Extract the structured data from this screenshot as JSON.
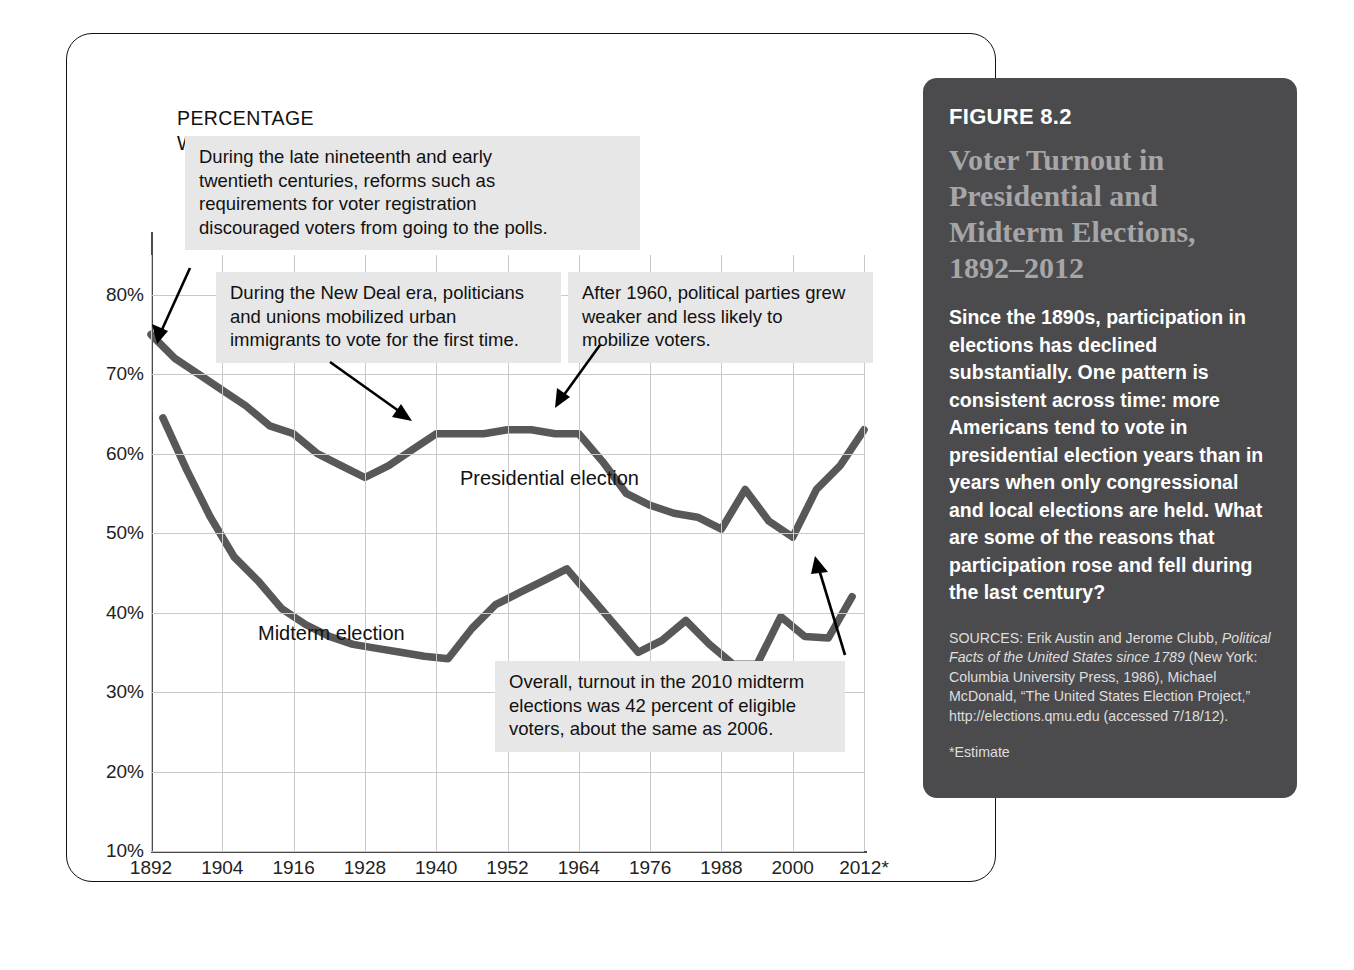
{
  "chart_data": {
    "type": "line",
    "title": "Voter Turnout in Presidential and Midterm Elections, 1892–2012",
    "xlabel": "",
    "ylabel": "PERCENTAGE\nWHO VOTED",
    "ylim": [
      10,
      85
    ],
    "xlim": [
      1892,
      2012
    ],
    "grid": true,
    "legend_position": "in-plot",
    "ytick_labels": [
      "80%",
      "70%",
      "60%",
      "50%",
      "40%",
      "30%",
      "20%",
      "10%"
    ],
    "ytick_values": [
      80,
      70,
      60,
      50,
      40,
      30,
      20,
      10
    ],
    "xtick_labels": [
      "1892",
      "1904",
      "1916",
      "1928",
      "1940",
      "1952",
      "1964",
      "1976",
      "1988",
      "2000",
      "2012*"
    ],
    "xtick_values": [
      1892,
      1904,
      1916,
      1928,
      1940,
      1952,
      1964,
      1976,
      1988,
      2000,
      2012
    ],
    "series": [
      {
        "name": "Presidential election",
        "x": [
          1892,
          1896,
          1900,
          1904,
          1908,
          1912,
          1916,
          1920,
          1924,
          1928,
          1932,
          1936,
          1940,
          1944,
          1948,
          1952,
          1956,
          1960,
          1964,
          1968,
          1972,
          1976,
          1980,
          1984,
          1988,
          1992,
          1996,
          2000,
          2004,
          2008,
          2012
        ],
        "values": [
          75.0,
          72.0,
          70.0,
          68.0,
          66.0,
          63.5,
          62.5,
          60.0,
          58.5,
          57.0,
          58.5,
          60.5,
          62.5,
          62.5,
          62.5,
          63.0,
          63.0,
          62.5,
          62.5,
          59.0,
          55.0,
          53.5,
          52.5,
          52.0,
          50.5,
          55.5,
          51.5,
          49.5,
          55.5,
          58.5,
          63.0
        ]
      },
      {
        "name": "Midterm election",
        "x": [
          1894,
          1898,
          1902,
          1906,
          1910,
          1914,
          1918,
          1922,
          1926,
          1930,
          1934,
          1938,
          1942,
          1946,
          1950,
          1954,
          1958,
          1962,
          1966,
          1970,
          1974,
          1978,
          1982,
          1986,
          1990,
          1994,
          1998,
          2002,
          2006,
          2010
        ],
        "values": [
          64.5,
          58.0,
          52.0,
          47.0,
          44.0,
          40.5,
          38.5,
          37.0,
          36.0,
          35.5,
          35.0,
          34.5,
          34.2,
          38.0,
          41.0,
          42.5,
          44.0,
          45.5,
          42.0,
          38.5,
          35.0,
          36.5,
          39.0,
          36.0,
          33.5,
          33.5,
          39.5,
          37.0,
          36.8,
          42.0
        ]
      }
    ],
    "series_inplot_labels": [
      "Presidential election",
      "Midterm election"
    ],
    "annotations": [
      "During the late nineteenth and early\ntwentieth centuries, reforms such as\nrequirements for voter registration\ndiscouraged voters from going to the polls.",
      "During the New Deal era, politicians\nand unions mobilized urban\nimmigrants to vote for the first time.",
      "After 1960, political parties grew\nweaker and less likely to\nmobilize voters.",
      "Overall, turnout in the 2010 midterm\nelections was 42 percent of eligible\nvoters, about the same as 2006."
    ]
  },
  "figure_panel": {
    "number": "FIGURE 8.2",
    "title": "Voter Turnout in\nPresidential and\nMidterm Elections,\n1892–2012",
    "body": "Since the 1890s, participation in elections has declined substantially. One pattern is consistent across time: more Americans tend to vote in presidential election years than in years when only congressional and local elections are held. What are some of the reasons that participation rose and fell during the last century?",
    "sources_prefix": "SOURCES: Erik Austin and Jerome Clubb,",
    "sources_italic_1": "Political Facts of the United States since 1789",
    "sources_rest": "(New York: Columbia University Press, 1986), Michael McDonald, “The United States Election Project,” http://elections.qmu.edu (accessed 7/18/12).",
    "note": "*Estimate"
  },
  "colors": {
    "panel_bg": "#4b4b4d",
    "panel_title": "#a6a6a8",
    "series_line": "#58585a",
    "callout_bg": "#e7e7e7",
    "grid": "#c9c9c9"
  }
}
